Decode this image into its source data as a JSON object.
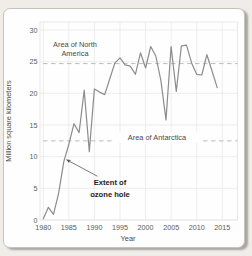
{
  "chart_data": {
    "type": "line",
    "title": "",
    "xlabel": "Year",
    "ylabel": "Million square kilometers",
    "xlim": [
      1979.3,
      2018
    ],
    "ylim": [
      0,
      30
    ],
    "x_ticks": [
      1980,
      1985,
      1990,
      1995,
      2000,
      2005,
      2010,
      2015
    ],
    "y_ticks": [
      0,
      5,
      10,
      15,
      20,
      25,
      30
    ],
    "grid": true,
    "legend": "none",
    "series": [
      {
        "name": "Extent of ozone hole",
        "color": "#8c8c8c",
        "x": [
          1980,
          1981,
          1982,
          1983,
          1984,
          1985,
          1986,
          1987,
          1988,
          1989,
          1990,
          1991,
          1992,
          1993,
          1994,
          1995,
          1996,
          1997,
          1998,
          1999,
          2000,
          2001,
          2002,
          2003,
          2004,
          2005,
          2006,
          2007,
          2008,
          2009,
          2010,
          2011,
          2012,
          2013,
          2014
        ],
        "y": [
          0.2,
          2.0,
          0.9,
          4.2,
          9.2,
          12.0,
          15.2,
          13.8,
          20.5,
          10.8,
          20.7,
          20.2,
          19.8,
          22.3,
          24.8,
          25.6,
          24.5,
          24.3,
          23.0,
          26.4,
          24.0,
          27.4,
          25.9,
          22.0,
          15.8,
          27.4,
          20.3,
          27.5,
          27.6,
          24.8,
          23.0,
          22.9,
          26.1,
          23.5,
          20.9
        ]
      }
    ],
    "reference_lines": [
      {
        "id": "north-america",
        "label_line1": "Area of North",
        "label_line2": "America",
        "value": 24.7,
        "style": "dashed",
        "color": "#b5b5b5",
        "label_position": "above-left"
      },
      {
        "id": "antarctica",
        "label_line1": "Area of Antarctica",
        "label_line2": "",
        "value": 12.5,
        "style": "dashed",
        "color": "#b5b5b5",
        "label_position": "on-line-center"
      }
    ],
    "annotation": {
      "text_line1": "Extent of",
      "text_line2": "ozone hole",
      "arrow_from": {
        "year": 1990.6,
        "value": 6.9
      },
      "arrow_to": {
        "year": 1984.6,
        "value": 9.5
      }
    }
  }
}
